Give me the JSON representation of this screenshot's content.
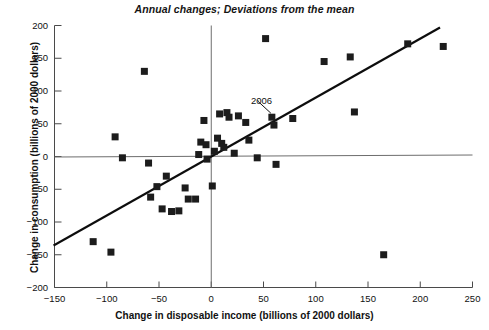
{
  "chart": {
    "title": "Annual changes; Deviations from the mean",
    "xlabel": "Change in disposable income (billions of 2000 dollars)",
    "ylabel": "Change in consumption (billions of 2000 dollars)",
    "annotation_label": "2006"
  },
  "chart_data": {
    "type": "scatter",
    "title": "Annual changes; Deviations from the mean",
    "xlabel": "Change in disposable income (billions of 2000 dollars)",
    "ylabel": "Change in consumption (billions of 2000 dollars)",
    "xlim": [
      -150,
      250
    ],
    "ylim": [
      -200,
      200
    ],
    "xticks": [
      -150,
      -100,
      -50,
      0,
      50,
      100,
      150,
      200,
      250
    ],
    "yticks": [
      -200,
      -150,
      -100,
      -50,
      0,
      50,
      100,
      150,
      200
    ],
    "xtick_labels": [
      "−150",
      "−100",
      "−50",
      "0",
      "50",
      "100",
      "150",
      "200",
      "250"
    ],
    "ytick_labels": [
      "−200",
      "−150",
      "−100",
      "−50",
      "0",
      "50",
      "100",
      "150",
      "200"
    ],
    "grid": false,
    "legend": "none",
    "marker": "square",
    "marker_color": "#1c1c1c",
    "points": [
      {
        "x": -113,
        "y": -130
      },
      {
        "x": -96,
        "y": -146
      },
      {
        "x": -92,
        "y": 30
      },
      {
        "x": -85,
        "y": -2
      },
      {
        "x": -64,
        "y": 130
      },
      {
        "x": -60,
        "y": -10
      },
      {
        "x": -58,
        "y": -62
      },
      {
        "x": -52,
        "y": -46
      },
      {
        "x": -47,
        "y": -80
      },
      {
        "x": -43,
        "y": -30
      },
      {
        "x": -38,
        "y": -84
      },
      {
        "x": -31,
        "y": -83
      },
      {
        "x": -25,
        "y": -48
      },
      {
        "x": -22,
        "y": -65
      },
      {
        "x": -15,
        "y": -65
      },
      {
        "x": -12,
        "y": 3
      },
      {
        "x": -10,
        "y": 22
      },
      {
        "x": -7,
        "y": 55
      },
      {
        "x": -5,
        "y": 18
      },
      {
        "x": -4,
        "y": -4
      },
      {
        "x": 1,
        "y": -45
      },
      {
        "x": 3,
        "y": 8
      },
      {
        "x": 6,
        "y": 28
      },
      {
        "x": 8,
        "y": 65
      },
      {
        "x": 10,
        "y": 20
      },
      {
        "x": 12,
        "y": 14
      },
      {
        "x": 15,
        "y": 67
      },
      {
        "x": 17,
        "y": 60
      },
      {
        "x": 22,
        "y": 5
      },
      {
        "x": 26,
        "y": 62
      },
      {
        "x": 33,
        "y": 52
      },
      {
        "x": 36,
        "y": 25
      },
      {
        "x": 44,
        "y": -2
      },
      {
        "x": 52,
        "y": 180
      },
      {
        "x": 58,
        "y": 60,
        "label": "2006"
      },
      {
        "x": 60,
        "y": 48
      },
      {
        "x": 62,
        "y": -12
      },
      {
        "x": 78,
        "y": 58
      },
      {
        "x": 108,
        "y": 145
      },
      {
        "x": 133,
        "y": 152
      },
      {
        "x": 137,
        "y": 68
      },
      {
        "x": 165,
        "y": -150
      },
      {
        "x": 188,
        "y": 172
      },
      {
        "x": 222,
        "y": 168
      }
    ],
    "trend_line": {
      "x_start": -150,
      "y_start": -135,
      "x_end": 218,
      "y_end": 196
    },
    "zero_lines": {
      "horizontal_y": 0,
      "vertical_x": 0
    }
  }
}
